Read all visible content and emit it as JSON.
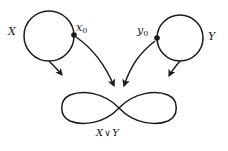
{
  "figure": {
    "type": "wedge-sum-topology-diagram",
    "background_color": "#ffffff",
    "stroke_color": "#1a1a1a",
    "labels": {
      "space_x": "X",
      "space_y": "Y",
      "basepoint_x": "x",
      "basepoint_x_sub": "0",
      "basepoint_y": "y",
      "basepoint_y_sub": "0",
      "wedge_left": "X",
      "wedge_operator": "∨",
      "wedge_right": "Y"
    },
    "shapes": {
      "circle_x": {
        "name": "circle-x",
        "cx": 49,
        "cy": 36,
        "r": 25
      },
      "circle_y": {
        "name": "circle-y",
        "cx": 180,
        "cy": 38,
        "r": 23
      },
      "basepoint_x_dot": {
        "cx": 74,
        "cy": 35,
        "r": 2.6
      },
      "basepoint_y_dot": {
        "cx": 157,
        "cy": 38,
        "r": 2.6
      },
      "figure_eight": {
        "name": "figure-eight-wedge",
        "crossing_x": 119,
        "crossing_y": 108
      }
    }
  }
}
